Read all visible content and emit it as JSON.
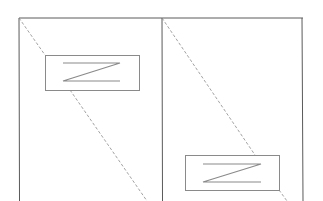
{
  "diagram": {
    "width": 323,
    "height": 201,
    "colors": {
      "frame": "#5a5a5a",
      "box": "#8a8a8a",
      "glyph": "#8a8a8a",
      "dashed": "#8a8a8a",
      "background": "#ffffff"
    },
    "frame": {
      "x1": 19,
      "y1": 18,
      "x2": 303,
      "y2": 201,
      "divider_x": 162
    },
    "panels": [
      {
        "name": "left",
        "box": {
          "x": 45,
          "y": 55,
          "w": 94,
          "h": 35
        },
        "glyph": "Z",
        "glyph_lines": {
          "x1": 63,
          "x2": 120,
          "y_top": 63,
          "y_bottom": 81
        },
        "dashed_segments": [
          {
            "x1": 19,
            "y1": 18,
            "x2": 45,
            "y2": 55
          },
          {
            "x1": 70,
            "y1": 90,
            "x2": 147,
            "y2": 201
          }
        ]
      },
      {
        "name": "right",
        "box": {
          "x": 185,
          "y": 155,
          "w": 94,
          "h": 35
        },
        "glyph": "Z",
        "glyph_lines": {
          "x1": 203,
          "x2": 261,
          "y_top": 164,
          "y_bottom": 182
        },
        "dashed_segments": [
          {
            "x1": 162,
            "y1": 18,
            "x2": 255,
            "y2": 155
          },
          {
            "x1": 279,
            "y1": 190,
            "x2": 287,
            "y2": 201
          }
        ]
      }
    ]
  }
}
